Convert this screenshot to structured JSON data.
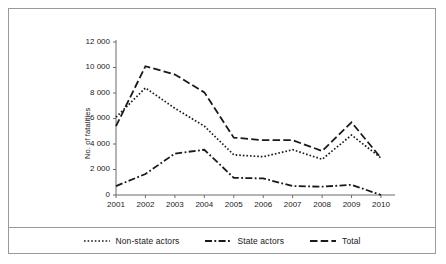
{
  "chart_data": {
    "type": "line",
    "title": "",
    "subtitle": "",
    "xlabel": "",
    "ylabel": "No. of fatalities",
    "categories": [
      "2001",
      "2002",
      "2003",
      "2004",
      "2005",
      "2006",
      "2007",
      "2008",
      "2009",
      "2010"
    ],
    "x": [
      2001,
      2002,
      2003,
      2004,
      2005,
      2006,
      2007,
      2008,
      2009,
      2010
    ],
    "ylim": [
      0,
      12000
    ],
    "yticks": [
      0,
      2000,
      4000,
      6000,
      8000,
      10000,
      12000
    ],
    "ytick_labels": [
      "0",
      "2 000",
      "4 000",
      "6 000",
      "8 000",
      "10 000",
      "12 000"
    ],
    "grid": false,
    "legend_position": "bottom",
    "series": [
      {
        "name": "Non-state actors",
        "style": "dotted",
        "color": "#1a1a1a",
        "values": [
          6100,
          8400,
          6800,
          5400,
          3150,
          3000,
          3550,
          2800,
          4700,
          2900
        ]
      },
      {
        "name": "State actors",
        "style": "dash-dot",
        "color": "#1a1a1a",
        "values": [
          700,
          1650,
          3250,
          3550,
          1350,
          1300,
          700,
          650,
          800,
          0
        ]
      },
      {
        "name": "Total",
        "style": "dashed",
        "color": "#1a1a1a",
        "values": [
          5400,
          10100,
          9450,
          8050,
          4500,
          4300,
          4300,
          3450,
          5700,
          2900
        ]
      }
    ]
  },
  "legend": {
    "entries": [
      {
        "label": "Non-state actors",
        "style": "dotted"
      },
      {
        "label": "State actors",
        "style": "dash-dot"
      },
      {
        "label": "Total",
        "style": "dashed"
      }
    ]
  },
  "axes": {
    "ylabel": "No. of fatalities"
  }
}
